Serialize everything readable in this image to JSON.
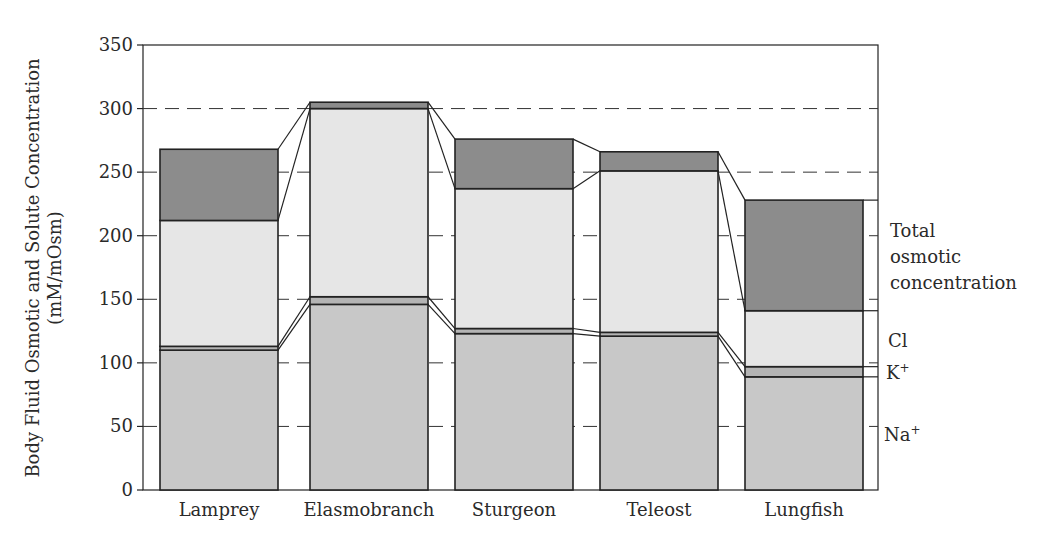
{
  "chart_data": {
    "type": "bar",
    "subtype": "stacked",
    "title": "",
    "xlabel": "",
    "ylabel": "Body Fluid Osmotic and Solute Concentration",
    "ylabel_units": "(mM/mOsm)",
    "ylim": [
      0,
      350
    ],
    "yticks": [
      0,
      50,
      100,
      150,
      200,
      250,
      300,
      350
    ],
    "grid": "dashed horizontal lines at 50-unit intervals between bars",
    "categories": [
      "Lamprey",
      "Elasmobranch",
      "Sturgeon",
      "Teleost",
      "Lungfish"
    ],
    "series": [
      {
        "name": "Na+",
        "values": [
          110,
          146,
          123,
          121,
          89
        ]
      },
      {
        "name": "K+",
        "values": [
          3,
          6,
          4,
          3,
          8
        ]
      },
      {
        "name": "Cl",
        "values": [
          99,
          148,
          110,
          127,
          44
        ]
      },
      {
        "name": "Total osmotic concentration (remainder)",
        "values": [
          56,
          5,
          39,
          15,
          87
        ]
      }
    ],
    "totals": [
      268,
      305,
      276,
      266,
      228
    ],
    "cumulative_tops": {
      "Na+": [
        110,
        146,
        123,
        121,
        89
      ],
      "K+": [
        113,
        152,
        127,
        124,
        97
      ],
      "Cl": [
        212,
        300,
        237,
        251,
        141
      ],
      "Total": [
        268,
        305,
        276,
        266,
        228
      ]
    },
    "legend": {
      "position": "right",
      "entries": [
        "Total osmotic concentration",
        "Cl",
        "K+",
        "Na+"
      ]
    }
  },
  "axis": {
    "ytick_labels": [
      "0",
      "50",
      "100",
      "150",
      "200",
      "250",
      "300",
      "350"
    ],
    "ylabel_line1": "Body Fluid Osmotic and Solute Concentration",
    "ylabel_line2": "(mM/mOsm)"
  },
  "legend": {
    "total_line1": "Total",
    "total_line2": "osmotic",
    "total_line3": "concentration",
    "cl": "Cl",
    "k": "K",
    "k_sup": "+",
    "na": "Na",
    "na_sup": "+"
  },
  "colors": {
    "total_fill": "#8c8c8c",
    "cl_fill": "#e6e6e6",
    "k_fill": "#b4b4b4",
    "na_fill": "#c8c8c8",
    "outline": "#222222"
  }
}
